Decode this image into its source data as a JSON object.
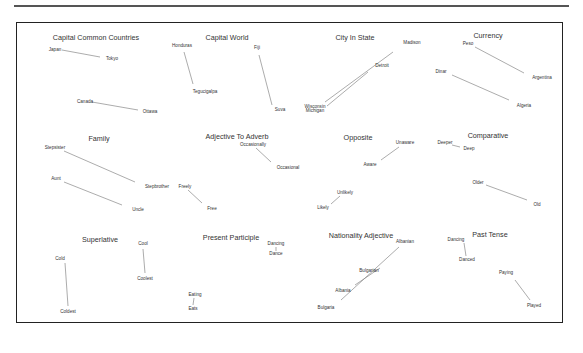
{
  "diagram": {
    "type": "word-embedding-analogy-plot",
    "groups": [
      {
        "title": "Capital Common Countries",
        "tx": 96,
        "ty": 33,
        "words": [
          {
            "t": "Japan",
            "x": 55,
            "y": 50
          },
          {
            "t": "Tokyo",
            "x": 112,
            "y": 59
          },
          {
            "t": "Canada",
            "x": 85,
            "y": 102
          },
          {
            "t": "Ottawa",
            "x": 150,
            "y": 112
          }
        ],
        "lines": [
          [
            62,
            50,
            100,
            57
          ],
          [
            92,
            102,
            138,
            110
          ]
        ]
      },
      {
        "title": "Capital World",
        "tx": 227,
        "ty": 33,
        "words": [
          {
            "t": "Honduras",
            "x": 182,
            "y": 46
          },
          {
            "t": "Tegucigalpa",
            "x": 205,
            "y": 92
          },
          {
            "t": "Fiji",
            "x": 257,
            "y": 48
          },
          {
            "t": "Suva",
            "x": 280,
            "y": 110
          }
        ],
        "lines": [
          [
            184,
            52,
            193,
            84
          ],
          [
            259,
            55,
            272,
            105
          ]
        ]
      },
      {
        "title": "City In State",
        "tx": 355,
        "ty": 33,
        "words": [
          {
            "t": "Madison",
            "x": 412,
            "y": 43
          },
          {
            "t": "Detroit",
            "x": 382,
            "y": 66
          },
          {
            "t": "Wisconsin",
            "x": 315,
            "y": 107
          },
          {
            "t": "Michigan",
            "x": 315,
            "y": 111
          }
        ],
        "lines": [
          [
            393,
            52,
            325,
            102
          ],
          [
            368,
            72,
            327,
            106
          ]
        ]
      },
      {
        "title": "Currency",
        "tx": 488,
        "ty": 31,
        "words": [
          {
            "t": "Peso",
            "x": 468,
            "y": 44
          },
          {
            "t": "Argentina",
            "x": 542,
            "y": 78
          },
          {
            "t": "Dinar",
            "x": 441,
            "y": 72
          },
          {
            "t": "Algeria",
            "x": 524,
            "y": 106
          }
        ],
        "lines": [
          [
            475,
            47,
            524,
            73
          ],
          [
            452,
            75,
            509,
            100
          ]
        ]
      },
      {
        "title": "Family",
        "tx": 99,
        "ty": 134,
        "words": [
          {
            "t": "Stepsister",
            "x": 55,
            "y": 148
          },
          {
            "t": "Stepbrother",
            "x": 157,
            "y": 187
          },
          {
            "t": "Aunt",
            "x": 56,
            "y": 179
          },
          {
            "t": "Uncle",
            "x": 138,
            "y": 210
          }
        ],
        "lines": [
          [
            64,
            151,
            135,
            182
          ],
          [
            64,
            182,
            122,
            205
          ]
        ]
      },
      {
        "title": "Adjective To Adverb",
        "tx": 237,
        "ty": 132,
        "words": [
          {
            "t": "Occasionally",
            "x": 253,
            "y": 145
          },
          {
            "t": "Occasional",
            "x": 288,
            "y": 168
          },
          {
            "t": "Freely",
            "x": 185,
            "y": 187
          },
          {
            "t": "Free",
            "x": 212,
            "y": 209
          }
        ],
        "lines": [
          [
            256,
            148,
            271,
            162
          ],
          [
            188,
            190,
            202,
            203
          ]
        ]
      },
      {
        "title": "Opposite",
        "tx": 358,
        "ty": 133,
        "words": [
          {
            "t": "Unaware",
            "x": 405,
            "y": 143
          },
          {
            "t": "Aware",
            "x": 370,
            "y": 165
          },
          {
            "t": "Unlikely",
            "x": 345,
            "y": 193
          },
          {
            "t": "Likely",
            "x": 323,
            "y": 208
          }
        ],
        "lines": [
          [
            399,
            147,
            381,
            160
          ],
          [
            340,
            196,
            331,
            204
          ]
        ]
      },
      {
        "title": "Comparative",
        "tx": 488,
        "ty": 131,
        "words": [
          {
            "t": "Deeper",
            "x": 445,
            "y": 143
          },
          {
            "t": "Deep",
            "x": 469,
            "y": 149
          },
          {
            "t": "Older",
            "x": 478,
            "y": 183
          },
          {
            "t": "Old",
            "x": 537,
            "y": 205
          }
        ],
        "lines": [
          [
            452,
            145,
            460,
            147
          ],
          [
            486,
            185,
            527,
            200
          ]
        ]
      },
      {
        "title": "Superlative",
        "tx": 100,
        "ty": 235,
        "words": [
          {
            "t": "Cold",
            "x": 60,
            "y": 259
          },
          {
            "t": "Coldest",
            "x": 68,
            "y": 312
          },
          {
            "t": "Cool",
            "x": 143,
            "y": 244
          },
          {
            "t": "Coolest",
            "x": 145,
            "y": 279
          }
        ],
        "lines": [
          [
            65,
            263,
            68,
            306
          ],
          [
            143,
            249,
            145,
            273
          ]
        ]
      },
      {
        "title": "Present Participle",
        "tx": 231,
        "ty": 233,
        "words": [
          {
            "t": "Dancing",
            "x": 276,
            "y": 244
          },
          {
            "t": "Dance",
            "x": 276,
            "y": 254
          },
          {
            "t": "Eating",
            "x": 195,
            "y": 295
          },
          {
            "t": "Eats",
            "x": 193,
            "y": 309
          }
        ],
        "lines": [
          [
            276,
            247,
            276,
            251
          ],
          [
            194,
            298,
            193,
            305
          ]
        ]
      },
      {
        "title": "Nationality Adjective",
        "tx": 361,
        "ty": 231,
        "words": [
          {
            "t": "Albanian",
            "x": 405,
            "y": 242
          },
          {
            "t": "Bulgarian",
            "x": 369,
            "y": 271
          },
          {
            "t": "Albania",
            "x": 343,
            "y": 291
          },
          {
            "t": "Bulgaria",
            "x": 326,
            "y": 308
          }
        ],
        "lines": [
          [
            399,
            247,
            341,
            300
          ],
          [
            380,
            268,
            355,
            285
          ]
        ]
      },
      {
        "title": "Past Tense",
        "tx": 490,
        "ty": 230,
        "words": [
          {
            "t": "Dancing",
            "x": 456,
            "y": 240
          },
          {
            "t": "Danced",
            "x": 467,
            "y": 260
          },
          {
            "t": "Paying",
            "x": 506,
            "y": 273
          },
          {
            "t": "Played",
            "x": 534,
            "y": 306
          }
        ],
        "lines": [
          [
            464,
            243,
            466,
            256
          ],
          [
            515,
            280,
            530,
            300
          ]
        ]
      }
    ]
  }
}
